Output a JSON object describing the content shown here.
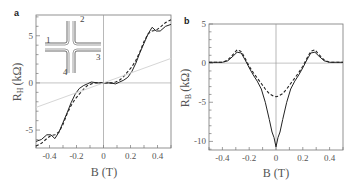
{
  "figure": {
    "panels": [
      {
        "label": "a"
      },
      {
        "label": "b"
      }
    ]
  },
  "chart_data": [
    {
      "type": "line",
      "panel": "a",
      "xlabel": "B (T)",
      "ylabel": "R_H (kΩ)",
      "ylabel_main": "R",
      "ylabel_sub": "H",
      "ylabel_unit": "(kΩ)",
      "xlim": [
        -0.5,
        0.5
      ],
      "ylim": [
        -6.9,
        7.2
      ],
      "xticks": [
        -0.4,
        -0.2,
        0,
        0.2,
        0.4
      ],
      "xtick_labels": [
        "-0.4",
        "-0.2",
        "0",
        "0.2",
        "0.4"
      ],
      "yticks": [
        -5,
        0,
        5
      ],
      "ytick_labels": [
        "-5",
        "0",
        "5"
      ],
      "grid": false,
      "inset": {
        "description": "cross-shaped junction",
        "terminals": [
          "1",
          "2",
          "3",
          "4"
        ]
      },
      "series": [
        {
          "name": "solid",
          "style": "solid",
          "x": [
            -0.5,
            -0.46,
            -0.42,
            -0.39,
            -0.36,
            -0.33,
            -0.3,
            -0.27,
            -0.24,
            -0.21,
            -0.18,
            -0.15,
            -0.12,
            -0.09,
            -0.07,
            -0.04,
            0,
            0.04,
            0.07,
            0.09,
            0.12,
            0.15,
            0.18,
            0.21,
            0.24,
            0.27,
            0.3,
            0.33,
            0.36,
            0.39,
            0.42,
            0.46,
            0.5
          ],
          "y": [
            -6.2,
            -6.0,
            -5.5,
            -5.5,
            -5.9,
            -5.2,
            -4.2,
            -3.2,
            -2.1,
            -1.2,
            -0.6,
            -0.3,
            -0.1,
            0.1,
            0.05,
            0.0,
            0.0,
            0.0,
            -0.05,
            -0.1,
            0.1,
            0.3,
            0.6,
            1.2,
            2.1,
            3.2,
            4.2,
            5.2,
            5.9,
            5.5,
            5.5,
            6.0,
            6.2
          ]
        },
        {
          "name": "dashed",
          "style": "dashed",
          "x": [
            -0.5,
            -0.46,
            -0.42,
            -0.39,
            -0.36,
            -0.33,
            -0.3,
            -0.27,
            -0.24,
            -0.21,
            -0.18,
            -0.15,
            -0.12,
            -0.09,
            -0.06,
            -0.03,
            0,
            0.03,
            0.06,
            0.09,
            0.12,
            0.15,
            0.18,
            0.21,
            0.24,
            0.27,
            0.3,
            0.33,
            0.36,
            0.39,
            0.42,
            0.46,
            0.5
          ],
          "y": [
            -6.7,
            -6.4,
            -5.9,
            -5.6,
            -5.5,
            -5.2,
            -4.4,
            -3.3,
            -2.4,
            -1.7,
            -1.2,
            -0.7,
            -0.3,
            -0.1,
            0.0,
            0.0,
            0.0,
            0.0,
            0.0,
            0.1,
            0.3,
            0.7,
            1.2,
            1.7,
            2.4,
            3.3,
            4.4,
            5.2,
            5.5,
            5.6,
            5.9,
            6.4,
            6.7
          ]
        },
        {
          "name": "linear",
          "style": "light",
          "x": [
            -0.5,
            0.5
          ],
          "y": [
            -2.6,
            2.6
          ]
        }
      ]
    },
    {
      "type": "line",
      "panel": "b",
      "xlabel": "B (T)",
      "ylabel": "R_B (kΩ)",
      "ylabel_main": "R",
      "ylabel_sub": "B",
      "ylabel_unit": "(kΩ)",
      "xlim": [
        -0.5,
        0.5
      ],
      "ylim": [
        -11.1,
        5
      ],
      "xticks": [
        -0.4,
        -0.2,
        0,
        0.2,
        0.4
      ],
      "xtick_labels": [
        "-0.4",
        "-0.2",
        "0",
        "0.2",
        "0.4"
      ],
      "yticks": [
        -10,
        -5,
        0,
        5
      ],
      "ytick_labels": [
        "-10",
        "-5",
        "0",
        "5"
      ],
      "grid": false,
      "series": [
        {
          "name": "solid",
          "style": "solid",
          "x": [
            -0.5,
            -0.45,
            -0.4,
            -0.36,
            -0.32,
            -0.29,
            -0.26,
            -0.23,
            -0.2,
            -0.17,
            -0.14,
            -0.11,
            -0.08,
            -0.05,
            -0.03,
            -0.015,
            0,
            0.015,
            0.03,
            0.05,
            0.08,
            0.11,
            0.14,
            0.17,
            0.2,
            0.23,
            0.26,
            0.29,
            0.32,
            0.36,
            0.4,
            0.45,
            0.5
          ],
          "y": [
            0.1,
            0.1,
            0.1,
            0.3,
            0.9,
            1.4,
            1.3,
            0.4,
            -0.6,
            -1.5,
            -2.3,
            -3.3,
            -5.0,
            -7.2,
            -8.8,
            -9.5,
            -10.7,
            -9.5,
            -8.8,
            -7.2,
            -5.0,
            -3.3,
            -2.3,
            -1.5,
            -0.6,
            0.4,
            1.3,
            1.4,
            0.9,
            0.3,
            0.1,
            0.1,
            0.1
          ]
        },
        {
          "name": "dashed",
          "style": "dashed",
          "x": [
            -0.5,
            -0.45,
            -0.4,
            -0.36,
            -0.32,
            -0.29,
            -0.26,
            -0.23,
            -0.2,
            -0.17,
            -0.14,
            -0.11,
            -0.08,
            -0.05,
            -0.02,
            0,
            0.02,
            0.05,
            0.08,
            0.11,
            0.14,
            0.17,
            0.2,
            0.23,
            0.26,
            0.29,
            0.32,
            0.36,
            0.4,
            0.45,
            0.5
          ],
          "y": [
            0.1,
            0.1,
            0.1,
            0.4,
            1.1,
            1.7,
            1.5,
            0.6,
            -0.4,
            -1.2,
            -1.9,
            -2.6,
            -3.3,
            -3.9,
            -4.2,
            -4.3,
            -4.2,
            -3.9,
            -3.3,
            -2.6,
            -1.9,
            -1.2,
            -0.4,
            0.6,
            1.5,
            1.7,
            1.1,
            0.4,
            0.1,
            0.1,
            0.1
          ]
        }
      ]
    }
  ]
}
